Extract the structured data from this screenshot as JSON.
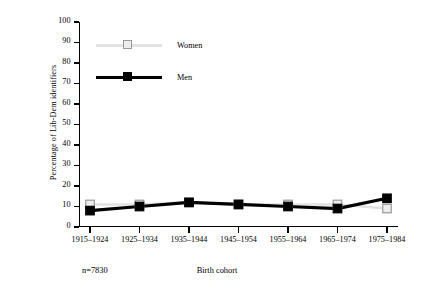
{
  "chart_data": {
    "type": "line",
    "title": "",
    "xlabel": "Birth cohort",
    "ylabel": "Percentage of Lib-Dem identifiers",
    "categories": [
      "1915–1924",
      "1925–1934",
      "1935–1944",
      "1945–1954",
      "1955–1964",
      "1965–1974",
      "1975–1984"
    ],
    "series": [
      {
        "name": "Women",
        "values": [
          11,
          11,
          12,
          11,
          11,
          11,
          9
        ],
        "color": "#e2e2e2",
        "marker": "open-square",
        "marker_fill": "#ededed",
        "marker_edge": "#9a9a9a"
      },
      {
        "name": "Men",
        "values": [
          8,
          10,
          12,
          11,
          10,
          9,
          14
        ],
        "color": "#000000",
        "marker": "filled-square",
        "marker_fill": "#000000",
        "marker_edge": "#000000"
      }
    ],
    "ylim": [
      0,
      100
    ],
    "yticks": [
      0,
      10,
      20,
      30,
      40,
      50,
      60,
      70,
      80,
      90,
      100
    ],
    "ytick_labels": [
      "0",
      "10",
      "20",
      "30",
      "40",
      "50",
      "60",
      "70",
      "80",
      "90",
      "100"
    ],
    "grid": false,
    "legend_position": "upper-left-inside",
    "annotation": "n=7830"
  },
  "legend": {
    "women_label": "Women",
    "men_label": "Men"
  },
  "footer": {
    "sample_size": "n=7830",
    "x_axis_title": "Birth cohort"
  }
}
